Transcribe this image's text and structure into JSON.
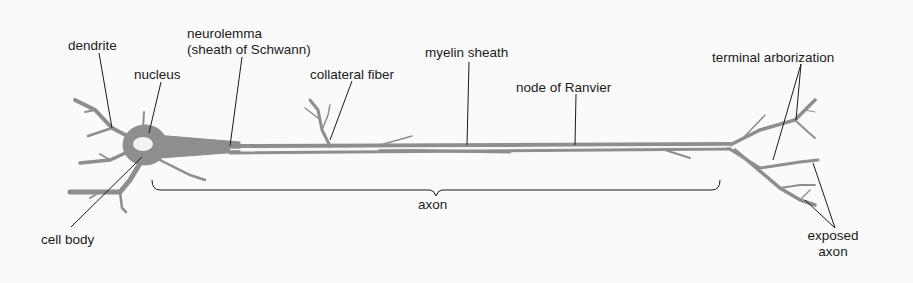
{
  "colors": {
    "tissue": "#8e8e8e",
    "line": "#1a1a1a",
    "nucleus": "#f2f2f2",
    "background": "#fafafa"
  },
  "labels": {
    "dendrite": "dendrite",
    "nucleus": "nucleus",
    "neurolemma_1": "neurolemma",
    "neurolemma_2": "(sheath of Schwann)",
    "collateral_fiber": "collateral fiber",
    "myelin_sheath": "myelin sheath",
    "node_of_ranvier": "node of Ranvier",
    "terminal_arborization": "terminal arborization",
    "cell_body": "cell body",
    "axon": "axon",
    "exposed_axon_1": "exposed",
    "exposed_axon_2": "axon"
  }
}
